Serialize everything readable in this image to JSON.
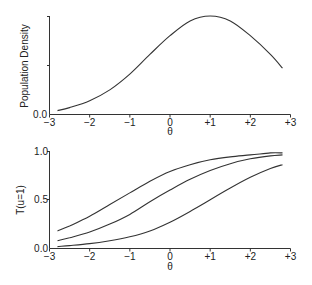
{
  "chart_data": [
    {
      "type": "line",
      "title": "",
      "xlabel": "θ",
      "ylabel": "Population Density",
      "xlim": [
        -3,
        3
      ],
      "ylim": [
        0,
        1
      ],
      "grid": false,
      "x_tick_labels": [
        "−3",
        "−2",
        "−1",
        "0",
        "+1",
        "+2",
        "+3"
      ],
      "x_ticks": [
        -3,
        -2,
        -1,
        0,
        1,
        2,
        3
      ],
      "y_tick_labels": [
        "0.0",
        "",
        ""
      ],
      "y_ticks": [
        0,
        0.5,
        1.0
      ],
      "series": [
        {
          "name": "Population Density",
          "x": [
            -2.8,
            -2.5,
            -2.0,
            -1.5,
            -1.0,
            -0.5,
            0.0,
            0.5,
            1.0,
            1.5,
            2.0,
            2.5,
            2.8
          ],
          "values": [
            0.04,
            0.07,
            0.14,
            0.25,
            0.41,
            0.61,
            0.8,
            0.95,
            1.0,
            0.95,
            0.8,
            0.61,
            0.47
          ]
        }
      ]
    },
    {
      "type": "line",
      "title": "",
      "xlabel": "θ",
      "ylabel": "T(u=1)",
      "xlim": [
        -3,
        3
      ],
      "ylim": [
        0,
        1
      ],
      "grid": false,
      "x_tick_labels": [
        "−3",
        "−2",
        "−1",
        "0",
        "+1",
        "+2",
        "+3"
      ],
      "x_ticks": [
        -3,
        -2,
        -1,
        0,
        1,
        2,
        3
      ],
      "y_tick_labels": [
        "0.0",
        "0.5",
        "1.0"
      ],
      "y_ticks": [
        0,
        0.5,
        1.0
      ],
      "series": [
        {
          "name": "Item 1 (easy)",
          "x": [
            -2.8,
            -2.5,
            -2.0,
            -1.5,
            -1.0,
            -0.5,
            0.0,
            0.5,
            1.0,
            1.5,
            2.0,
            2.5,
            2.8
          ],
          "values": [
            0.18,
            0.23,
            0.33,
            0.45,
            0.57,
            0.69,
            0.79,
            0.86,
            0.91,
            0.94,
            0.96,
            0.98,
            0.98
          ]
        },
        {
          "name": "Item 2 (medium)",
          "x": [
            -2.8,
            -2.5,
            -2.0,
            -1.5,
            -1.0,
            -0.5,
            0.0,
            0.5,
            1.0,
            1.5,
            2.0,
            2.5,
            2.8
          ],
          "values": [
            0.08,
            0.11,
            0.17,
            0.25,
            0.35,
            0.48,
            0.6,
            0.71,
            0.8,
            0.87,
            0.92,
            0.95,
            0.96
          ]
        },
        {
          "name": "Item 3 (hard)",
          "x": [
            -2.8,
            -2.5,
            -2.0,
            -1.5,
            -1.0,
            -0.5,
            0.0,
            0.5,
            1.0,
            1.5,
            2.0,
            2.5,
            2.8
          ],
          "values": [
            0.02,
            0.03,
            0.05,
            0.08,
            0.12,
            0.18,
            0.27,
            0.38,
            0.5,
            0.62,
            0.73,
            0.82,
            0.86
          ]
        }
      ]
    }
  ]
}
